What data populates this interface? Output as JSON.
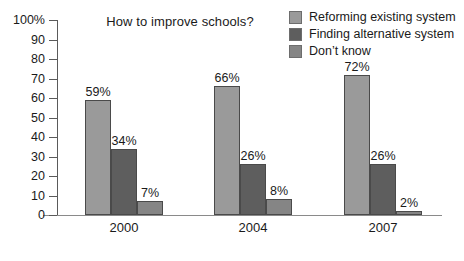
{
  "chart_data": {
    "type": "bar",
    "title": "How to improve schools?",
    "xlabel": "",
    "ylabel": "",
    "categories": [
      "2000",
      "2004",
      "2007"
    ],
    "series": [
      {
        "name": "Reforming existing system",
        "color": "#9a9a9a",
        "values": [
          59,
          66,
          72
        ],
        "labels": [
          "59%",
          "66%",
          "72%"
        ]
      },
      {
        "name": "Finding alternative system",
        "color": "#5e5e5e",
        "values": [
          34,
          26,
          26
        ],
        "labels": [
          "34%",
          "26%",
          "26%"
        ]
      },
      {
        "name": "Don’t know",
        "color": "#858585",
        "values": [
          7,
          8,
          2
        ],
        "labels": [
          "7%",
          "8%",
          "2%"
        ]
      }
    ],
    "ylim": [
      0,
      100
    ],
    "yticks": [
      0,
      10,
      20,
      30,
      40,
      50,
      60,
      70,
      80,
      90,
      100
    ],
    "ytick_labels": [
      "0",
      "10",
      "20",
      "30",
      "40",
      "50",
      "60",
      "70",
      "80",
      "90",
      "100%"
    ],
    "grid": false,
    "legend_position": "top-right"
  }
}
